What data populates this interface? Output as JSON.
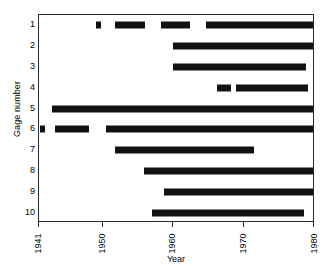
{
  "chart_data": {
    "type": "bar",
    "title": "",
    "subtitle": "",
    "xlabel": "Year",
    "ylabel": "Gage number",
    "xlim": [
      1941,
      1980
    ],
    "ylim": [
      0.5,
      10.5
    ],
    "grid": false,
    "legend": null,
    "x_ticks": [
      1941,
      1950,
      1960,
      1970,
      1980
    ],
    "x_tick_labels": [
      "1941",
      "1950",
      "1960",
      "1970",
      "1980"
    ],
    "y_ticks": [
      1,
      2,
      3,
      4,
      5,
      6,
      7,
      8,
      9,
      10
    ],
    "y_tick_labels": [
      "1",
      "2",
      "3",
      "4",
      "5",
      "6",
      "7",
      "8",
      "9",
      "10"
    ],
    "orientation": "horizontal",
    "series": [
      {
        "name": "Gage 1",
        "gage": 1,
        "segments": [
          {
            "start": 1949.0,
            "end": 1949.7
          },
          {
            "start": 1951.7,
            "end": 1956.0
          },
          {
            "start": 1958.2,
            "end": 1962.3
          },
          {
            "start": 1964.6,
            "end": 1979.8
          }
        ]
      },
      {
        "name": "Gage 2",
        "gage": 2,
        "segments": [
          {
            "start": 1960.0,
            "end": 1979.8
          }
        ]
      },
      {
        "name": "Gage 3",
        "gage": 3,
        "segments": [
          {
            "start": 1960.0,
            "end": 1978.8
          }
        ]
      },
      {
        "name": "Gage 4",
        "gage": 4,
        "segments": [
          {
            "start": 1966.2,
            "end": 1968.2
          },
          {
            "start": 1968.9,
            "end": 1979.0
          }
        ]
      },
      {
        "name": "Gage 5",
        "gage": 5,
        "segments": [
          {
            "start": 1942.8,
            "end": 1979.9
          }
        ]
      },
      {
        "name": "Gage 6",
        "gage": 6,
        "segments": [
          {
            "start": 1941.1,
            "end": 1941.8
          },
          {
            "start": 1943.3,
            "end": 1948.1
          },
          {
            "start": 1950.4,
            "end": 1979.9
          }
        ]
      },
      {
        "name": "Gage 7",
        "gage": 7,
        "segments": [
          {
            "start": 1951.8,
            "end": 1971.4
          }
        ]
      },
      {
        "name": "Gage 8",
        "gage": 8,
        "segments": [
          {
            "start": 1955.9,
            "end": 1979.9
          }
        ]
      },
      {
        "name": "Gage 9",
        "gage": 9,
        "segments": [
          {
            "start": 1958.7,
            "end": 1979.9
          }
        ]
      },
      {
        "name": "Gage 10",
        "gage": 10,
        "segments": [
          {
            "start": 1957.0,
            "end": 1978.5
          }
        ]
      }
    ],
    "colors": {
      "bar": "#121212",
      "axis": "#2a2a2a",
      "background": "#ffffff"
    }
  }
}
